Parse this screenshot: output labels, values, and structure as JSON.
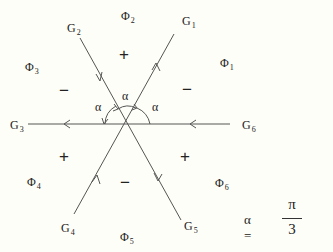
{
  "diagram": {
    "rays": [
      {
        "name": "G",
        "sub": "1",
        "direction": "outward"
      },
      {
        "name": "G",
        "sub": "2",
        "direction": "inward"
      },
      {
        "name": "G",
        "sub": "3",
        "direction": "outward"
      },
      {
        "name": "G",
        "sub": "4",
        "direction": "inward"
      },
      {
        "name": "G",
        "sub": "5",
        "direction": "outward"
      },
      {
        "name": "G",
        "sub": "6",
        "direction": "inward"
      }
    ],
    "regions": [
      {
        "name": "Φ",
        "sub": "1",
        "sign": "−"
      },
      {
        "name": "Φ",
        "sub": "2",
        "sign": "+"
      },
      {
        "name": "Φ",
        "sub": "3",
        "sign": "−"
      },
      {
        "name": "Φ",
        "sub": "4",
        "sign": "+"
      },
      {
        "name": "Φ",
        "sub": "5",
        "sign": "−"
      },
      {
        "name": "Φ",
        "sub": "6",
        "sign": "+"
      }
    ],
    "angle_label": "α",
    "formula": {
      "lhs": "α =",
      "numerator": "π",
      "denominator": "3"
    }
  }
}
